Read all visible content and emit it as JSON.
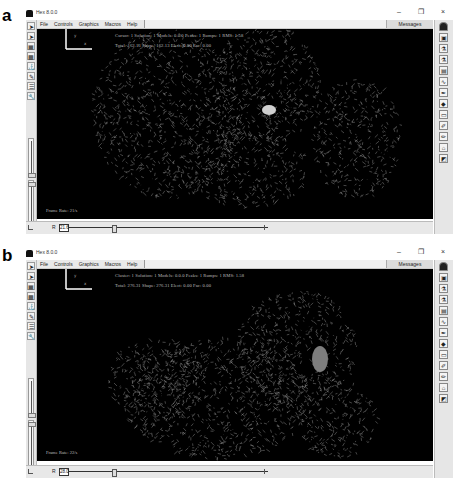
{
  "figure": {
    "panels": [
      {
        "letter": "a",
        "window": {
          "title": "Hex 8.0.0",
          "controls": {
            "minimize": "–",
            "maximize": "❐",
            "close": "×"
          }
        },
        "menu": [
          "File",
          "Controls",
          "Graphics",
          "Macros",
          "Help"
        ],
        "messages_label": "Messages",
        "overlay": {
          "line1": "Cursor: 1 Solution: 1 Models: 0.0.0 Peaks: 1 Rumps: 1 RMS: 1.58",
          "line2": "Total: 162.13 Shape: 162.13 Elect: 0.00 Fac: 0.00"
        },
        "frame_rate": "Frame Rate: 21/s",
        "r_label": "R",
        "r_value": "21.6",
        "r_slider_fraction": 0.22,
        "left_slider_fraction": 0.45,
        "left_tools": [
          "arrow-pointer-icon",
          "arrow-pointer-alt-icon",
          "grid-icon",
          "checker-icon",
          "dock-icon",
          "pencil-icon",
          "layers-icon",
          "wrench-icon"
        ],
        "right_tools": [
          "person-icon",
          "image-icon",
          "flask-icon",
          "flask-alt-icon",
          "chart-icon",
          "curve-icon",
          "pen-icon",
          "shape-icon",
          "rectangle-icon",
          "brush-icon",
          "paint-icon",
          "bucket-icon",
          "palette-icon"
        ]
      },
      {
        "letter": "b",
        "window": {
          "title": "Hex 8.0.0",
          "controls": {
            "minimize": "–",
            "maximize": "❐",
            "close": "×"
          }
        },
        "menu": [
          "File",
          "Controls",
          "Graphics",
          "Macros",
          "Help"
        ],
        "messages_label": "Messages",
        "overlay": {
          "line1": "Cluster: 1 Solution: 1 Models: 0.0.0 Peaks: 1 Rumps: 1 RMS: 1.58",
          "line2": "Total: 276.31 Shape: 276.31 Elect: 0.00 Fac: 0.00"
        },
        "frame_rate": "Frame Rate: 22/s",
        "r_label": "R",
        "r_value": "28.0",
        "r_slider_fraction": 0.22,
        "left_slider_fraction": 0.45,
        "left_tools": [
          "arrow-pointer-icon",
          "arrow-pointer-alt-icon",
          "grid-icon",
          "checker-icon",
          "dock-icon",
          "pencil-icon",
          "layers-icon",
          "wrench-icon"
        ],
        "right_tools": [
          "person-icon",
          "image-icon",
          "flask-icon",
          "flask-alt-icon",
          "chart-icon",
          "curve-icon",
          "pen-icon",
          "shape-icon",
          "rectangle-icon",
          "brush-icon",
          "paint-icon",
          "bucket-icon",
          "palette-icon"
        ]
      }
    ]
  },
  "colors": {
    "viewport_bg": "#000000",
    "wireframe": "#9a9a9a",
    "ligand_a": "#cfcfcf",
    "ligand_b": "#7d7d7d"
  }
}
